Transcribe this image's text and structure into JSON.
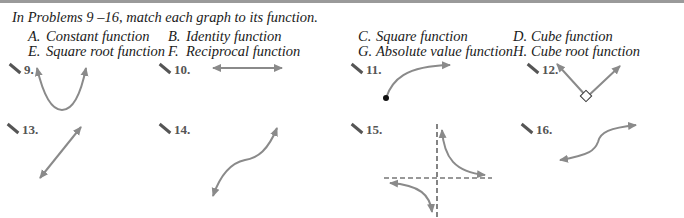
{
  "instructions": "In Problems 9 –16, match each graph to its function.",
  "choices": [
    {
      "letter": "A.",
      "label": "Constant function"
    },
    {
      "letter": "B.",
      "label": "Identity function"
    },
    {
      "letter": "C.",
      "label": "Square function"
    },
    {
      "letter": "D.",
      "label": "Cube function"
    },
    {
      "letter": "E.",
      "label": "Square root function"
    },
    {
      "letter": "F.",
      "label": "Reciprocal function"
    },
    {
      "letter": "G.",
      "label": "Absolute value function"
    },
    {
      "letter": "H.",
      "label": "Cube root function"
    }
  ],
  "problems": [
    {
      "number": "9.",
      "graph": "parabola-opening-up"
    },
    {
      "number": "10.",
      "graph": "horizontal-line"
    },
    {
      "number": "11.",
      "graph": "square-root-curve"
    },
    {
      "number": "12.",
      "graph": "v-shape-absolute-value"
    },
    {
      "number": "13.",
      "graph": "diagonal-line"
    },
    {
      "number": "14.",
      "graph": "cubic-curve"
    },
    {
      "number": "15.",
      "graph": "hyperbola-with-asymptotes"
    },
    {
      "number": "16.",
      "graph": "cube-root-curve"
    }
  ],
  "colors": {
    "curve": "#8a8a8a",
    "text": "#1a1a1a",
    "label": "#555555"
  }
}
